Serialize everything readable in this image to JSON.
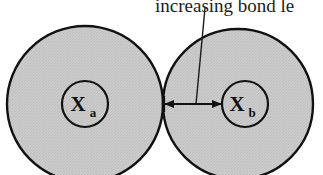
{
  "figure": {
    "name": "bond-length-diagram",
    "background_color": "#ffffff",
    "caption": {
      "text": "increasing bond le",
      "full_text_clipped": true,
      "x": 155,
      "y": 12,
      "font_size": 19
    },
    "leader_line": {
      "name": "caption-leader-line",
      "x1": 205,
      "y1": 8,
      "x2": 196,
      "y2": 104,
      "stroke": "#1c1c1c",
      "stroke_width": 1.4
    },
    "colors": {
      "fill_gray": "#c9c9c9",
      "outline": "#111111",
      "arrow": "#111111",
      "text": "#1c1c1c"
    },
    "atoms": [
      {
        "id": "atom-a",
        "label_symbol": "X",
        "label_subscript": "a",
        "outer_circle": {
          "cx": 85,
          "cy": 104,
          "r": 78
        },
        "inner_circle": {
          "cx": 85,
          "cy": 104,
          "r": 23
        },
        "symbol_x": 78,
        "symbol_y": 111,
        "subscript_x": 93,
        "subscript_y": 117
      },
      {
        "id": "atom-b",
        "label_symbol": "X",
        "label_subscript": "b",
        "outer_circle": {
          "cx": 238,
          "cy": 104,
          "r": 75
        },
        "inner_circle": {
          "cx": 245,
          "cy": 104,
          "r": 23
        },
        "symbol_x": 237,
        "symbol_y": 111,
        "subscript_x": 252,
        "subscript_y": 117
      }
    ],
    "bond_arrow": {
      "name": "bond-length-arrow",
      "x1": 164,
      "x2": 222,
      "y": 104,
      "double_headed": true,
      "stroke_width": 2.2,
      "head_size": 7
    },
    "tangent_point": {
      "x": 163,
      "y": 104
    }
  }
}
